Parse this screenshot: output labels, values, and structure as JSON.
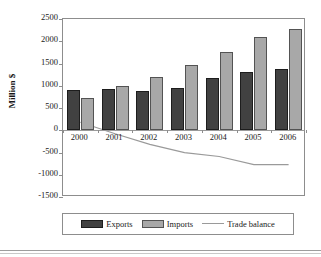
{
  "chart_data": {
    "type": "bar",
    "title": "",
    "xlabel": "",
    "ylabel": "Million $",
    "categories": [
      "2000",
      "2001",
      "2002",
      "2003",
      "2004",
      "2005",
      "2006"
    ],
    "ylim": [
      -1500,
      2500
    ],
    "yticks": [
      2500,
      2000,
      1500,
      1000,
      500,
      0,
      -500,
      -1000,
      -1500
    ],
    "ytick_labels": [
      "2500",
      "2000",
      "1500",
      "1000",
      "500",
      "0",
      "-500",
      "-1000",
      "-1500"
    ],
    "grid": false,
    "legend_position": "bottom",
    "series": [
      {
        "name": "Exports",
        "type": "bar",
        "color": "#414141",
        "values": [
          910,
          925,
          880,
          955,
          1170,
          1320,
          1385
        ]
      },
      {
        "name": "Imports",
        "type": "bar",
        "color": "#a8a8a8",
        "values": [
          730,
          1005,
          1195,
          1460,
          1760,
          2095,
          2270
        ]
      },
      {
        "name": "Trade balance",
        "type": "line",
        "color": "#9a9a9a",
        "values": [
          180,
          -80,
          -315,
          -505,
          -590,
          -775,
          -775
        ]
      }
    ]
  },
  "legend": {
    "items": [
      {
        "label": "Exports",
        "icon": "bar-swatch-dark"
      },
      {
        "label": "Imports",
        "icon": "bar-swatch-light"
      },
      {
        "label": "Trade balance",
        "icon": "line-swatch"
      }
    ]
  }
}
